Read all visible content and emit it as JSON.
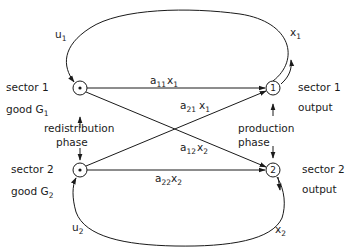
{
  "nodes": {
    "sector1_good": {
      "label_line1": "sector 1",
      "label_line2": "good G",
      "label_sub": "1",
      "marker": "dot"
    },
    "sector2_good": {
      "label_line1": "sector 2",
      "label_line2": "good G",
      "label_sub": "2",
      "marker": "dot"
    },
    "sector1_output": {
      "label_line1": "sector 1",
      "label_line2": "output",
      "marker": "1"
    },
    "sector2_output": {
      "label_line1": "sector 2",
      "label_line2": "output",
      "marker": "2"
    }
  },
  "phases": {
    "redistribution": {
      "line1": "redistribution",
      "line2": "phase"
    },
    "production": {
      "line1": "production",
      "line2": "phase"
    }
  },
  "edges": {
    "a11x1": {
      "a": "a",
      "asub": "11",
      "x": "x",
      "xsub": "1"
    },
    "a21x1": {
      "a": "a",
      "asub": "21",
      "x": "x",
      "xsub": "1"
    },
    "a12x2": {
      "a": "a",
      "asub": "12",
      "x": "x",
      "xsub": "2"
    },
    "a22x2": {
      "a": "a",
      "asub": "22",
      "x": "x",
      "xsub": "2"
    },
    "u1": {
      "v": "u",
      "sub": "1"
    },
    "x1": {
      "v": "x",
      "sub": "1"
    },
    "u2": {
      "v": "u",
      "sub": "2"
    },
    "x2": {
      "v": "x",
      "sub": "2"
    }
  }
}
